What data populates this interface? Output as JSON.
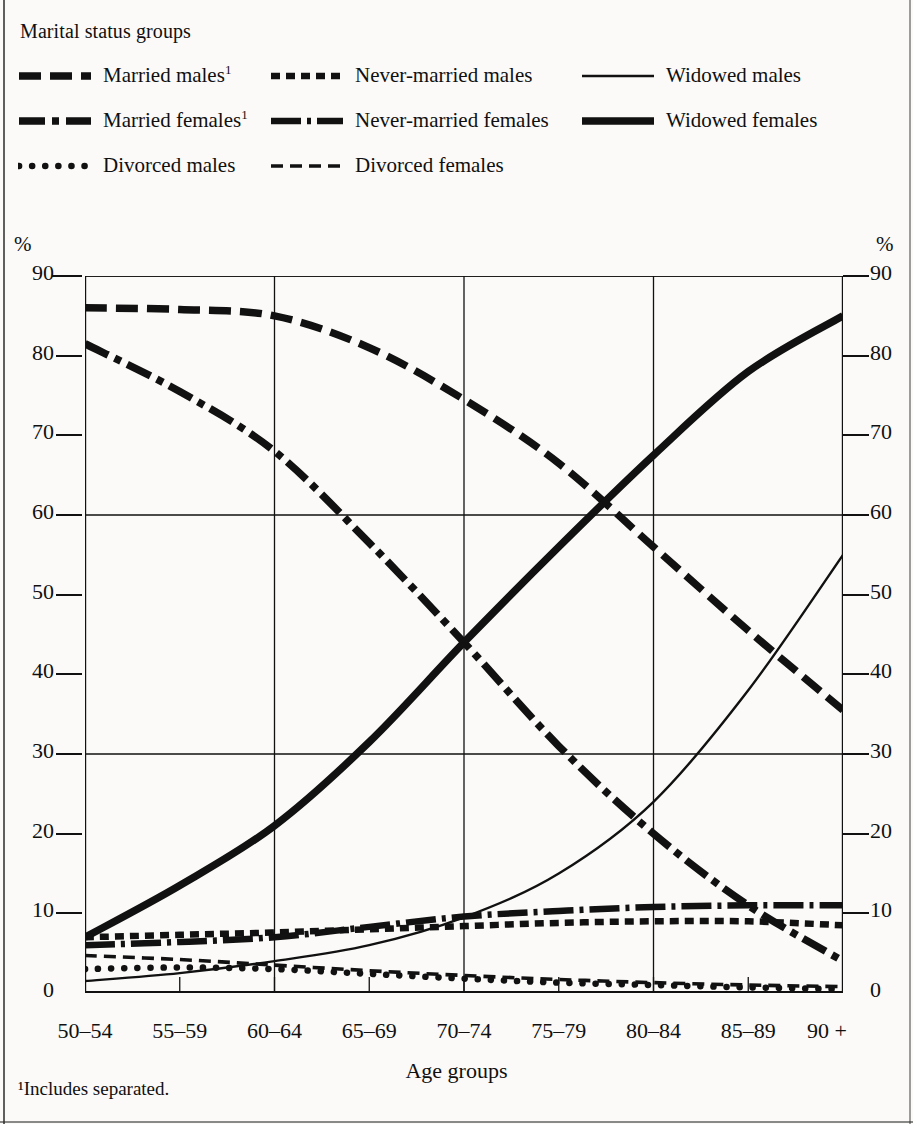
{
  "legend": {
    "title": "Marital status groups",
    "rows": [
      [
        {
          "label": "Married males",
          "sup": "1",
          "style": "long-dash-thick",
          "name": "married-males"
        },
        {
          "label": "Never-married males",
          "sup": "",
          "style": "dotted-thick",
          "name": "never-married-males"
        },
        {
          "label": "Widowed males",
          "sup": "",
          "style": "solid-thin",
          "name": "widowed-males"
        }
      ],
      [
        {
          "label": "Married females",
          "sup": "1",
          "style": "dash-dot-thick",
          "name": "married-females"
        },
        {
          "label": "Never-married females",
          "sup": "",
          "style": "dot-dash-medium",
          "name": "never-married-females"
        },
        {
          "label": "Widowed females",
          "sup": "",
          "style": "solid-thick",
          "name": "widowed-females"
        }
      ],
      [
        {
          "label": "Divorced males",
          "sup": "",
          "style": "round-dots",
          "name": "divorced-males"
        },
        {
          "label": "Divorced females",
          "sup": "",
          "style": "short-dash-thin",
          "name": "divorced-females"
        }
      ]
    ]
  },
  "footnote": "¹Includes separated.",
  "chart_data": {
    "type": "line",
    "title": "",
    "xlabel": "Age groups",
    "ylabel": "%",
    "ylabel_right": "%",
    "ylim": [
      0,
      90
    ],
    "yticks": [
      0,
      10,
      20,
      30,
      40,
      50,
      60,
      70,
      80,
      90
    ],
    "grid": {
      "horizontal_at": [
        30,
        60,
        90
      ],
      "vertical_at": [
        "60–64",
        "70–74",
        "80–84"
      ]
    },
    "legend_position": "above-plot",
    "categories": [
      "50–54",
      "55–59",
      "60–64",
      "65–69",
      "70–74",
      "75–79",
      "80–84",
      "85–89",
      "90 +"
    ],
    "series": [
      {
        "name": "Married males",
        "style": "long-dash-thick",
        "values": [
          86.0,
          85.8,
          85.0,
          81.0,
          74.5,
          66.5,
          56.0,
          45.5,
          35.5
        ]
      },
      {
        "name": "Married females",
        "style": "dash-dot-thick",
        "values": [
          81.5,
          75.5,
          68.0,
          56.5,
          44.0,
          31.0,
          20.0,
          11.0,
          4.0
        ]
      },
      {
        "name": "Widowed males",
        "style": "solid-thin",
        "values": [
          1.5,
          2.5,
          4.0,
          6.0,
          9.5,
          15.0,
          24.0,
          38.0,
          55.0
        ]
      },
      {
        "name": "Widowed females",
        "style": "solid-thick",
        "values": [
          7.0,
          13.5,
          21.0,
          31.5,
          44.0,
          56.0,
          67.5,
          78.0,
          85.0
        ]
      },
      {
        "name": "Never-married males",
        "style": "dotted-thick",
        "values": [
          7.0,
          7.3,
          7.6,
          8.0,
          8.4,
          8.8,
          9.0,
          9.0,
          8.5
        ]
      },
      {
        "name": "Never-married females",
        "style": "dot-dash-medium",
        "values": [
          6.0,
          6.4,
          7.0,
          8.3,
          9.6,
          10.3,
          10.8,
          11.0,
          11.0
        ]
      },
      {
        "name": "Divorced males",
        "style": "round-dots",
        "values": [
          3.0,
          3.2,
          3.0,
          2.4,
          1.8,
          1.3,
          1.0,
          0.7,
          0.5
        ]
      },
      {
        "name": "Divorced females",
        "style": "short-dash-thin",
        "values": [
          4.7,
          4.2,
          3.5,
          2.8,
          2.2,
          1.7,
          1.3,
          1.0,
          0.8
        ]
      }
    ]
  }
}
